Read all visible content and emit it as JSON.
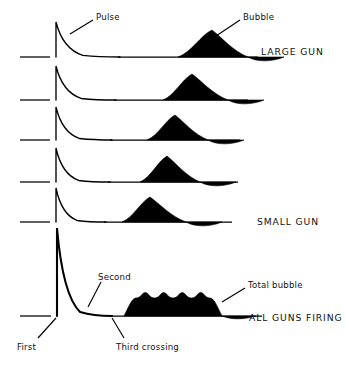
{
  "figure": {
    "title_visible": false,
    "background_color": "#ffffff",
    "ink_color": "#000000"
  },
  "annotations": [
    {
      "name": "pulse",
      "text": "Pulse",
      "x": 96,
      "y": 12,
      "leader": [
        [
          93,
          20
        ],
        [
          70,
          34
        ]
      ]
    },
    {
      "name": "bubble",
      "text": "Bubble",
      "x": 243,
      "y": 12,
      "leader": [
        [
          240,
          20
        ],
        [
          216,
          36
        ]
      ]
    },
    {
      "name": "second",
      "text": "Second",
      "x": 98,
      "y": 272,
      "leader": [
        [
          101,
          282
        ],
        [
          88,
          307
        ]
      ]
    },
    {
      "name": "total-bubble",
      "text": "Total bubble",
      "x": 248,
      "y": 280,
      "leader": [
        [
          245,
          288
        ],
        [
          222,
          302
        ]
      ]
    },
    {
      "name": "first",
      "text": "First",
      "x": 17,
      "y": 342,
      "leader": [
        [
          38,
          338
        ],
        [
          56,
          318
        ]
      ]
    },
    {
      "name": "third-crossing",
      "text": "Third crossing",
      "x": 116,
      "y": 342,
      "leader": [
        [
          124,
          338
        ],
        [
          112,
          318
        ]
      ]
    }
  ],
  "gun_labels": [
    {
      "name": "large-gun",
      "text": "LARGE GUN",
      "x": 261,
      "y": 46
    },
    {
      "name": "small-gun",
      "text": "SMALL GUN",
      "x": 257,
      "y": 216
    },
    {
      "name": "all-guns-firing",
      "text": "ALL GUNS FIRING",
      "x": 249,
      "y": 312
    }
  ],
  "chart_data": {
    "type": "line",
    "xlabel": "",
    "ylabel": "",
    "grid": false,
    "legend": "none",
    "axis_ranges": {
      "x": [
        0,
        345
      ],
      "y": [
        0,
        370
      ]
    },
    "series": [
      {
        "name": "trace-1-large-gun",
        "label": "LARGE GUN",
        "baseline_y": 57,
        "baseline_start_x": 20,
        "spike_x": 56,
        "spike_top_y": 22,
        "spike_amplitude_px": 35,
        "decay_end_x": 120,
        "bubble_start_x": 178,
        "bubble_peak_x": 212,
        "bubble_end_x": 248,
        "bubble_height_px": 27,
        "bubble_undershoot_px": 5,
        "trace_end_x": 258
      },
      {
        "name": "trace-2",
        "label": "",
        "baseline_y": 100,
        "baseline_start_x": 20,
        "spike_x": 56,
        "spike_top_y": 66,
        "spike_amplitude_px": 34,
        "decay_end_x": 116,
        "bubble_start_x": 163,
        "bubble_peak_x": 192,
        "bubble_end_x": 228,
        "bubble_height_px": 26,
        "bubble_undershoot_px": 5,
        "trace_end_x": 248
      },
      {
        "name": "trace-3",
        "label": "",
        "baseline_y": 140,
        "baseline_start_x": 20,
        "spike_x": 56,
        "spike_top_y": 107,
        "spike_amplitude_px": 33,
        "decay_end_x": 112,
        "bubble_start_x": 147,
        "bubble_peak_x": 175,
        "bubble_end_x": 208,
        "bubble_height_px": 25,
        "bubble_undershoot_px": 5,
        "trace_end_x": 240
      },
      {
        "name": "trace-4",
        "label": "",
        "baseline_y": 182,
        "baseline_start_x": 20,
        "spike_x": 56,
        "spike_top_y": 148,
        "spike_amplitude_px": 34,
        "decay_end_x": 110,
        "bubble_start_x": 140,
        "bubble_peak_x": 167,
        "bubble_end_x": 200,
        "bubble_height_px": 26,
        "bubble_undershoot_px": 5,
        "trace_end_x": 238
      },
      {
        "name": "trace-5-small-gun",
        "label": "SMALL GUN",
        "baseline_y": 222,
        "baseline_start_x": 20,
        "spike_x": 56,
        "spike_top_y": 188,
        "spike_amplitude_px": 34,
        "decay_end_x": 106,
        "bubble_start_x": 122,
        "bubble_peak_x": 150,
        "bubble_end_x": 186,
        "bubble_height_px": 25,
        "bubble_undershoot_px": 5,
        "trace_end_x": 232
      },
      {
        "name": "trace-6-all-guns-firing",
        "label": "ALL GUNS FIRING",
        "baseline_y": 316,
        "baseline_start_x": 20,
        "spike_x": 57,
        "spike_top_y": 228,
        "spike_amplitude_px": 88,
        "decay_end_x": 112,
        "bubble_start_x": 124,
        "bubble_plateau_y": 298,
        "bubble_end_x": 222,
        "bubble_height_px": 18,
        "bubble_humps": 4,
        "bubble_undershoot_px": 4,
        "trace_end_x": 262
      }
    ]
  }
}
